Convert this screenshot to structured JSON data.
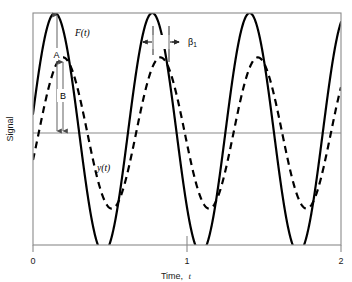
{
  "figure": {
    "y_axis_label": "Signal",
    "x_axis_label": "Time, t",
    "x_axis_label_main": "Time,",
    "x_axis_label_var": "t",
    "x_ticks": [
      "0",
      "1",
      "2"
    ],
    "curve_label_solid": "F(t)",
    "curve_label_dashed": "y(t)",
    "annotation_a": "A",
    "annotation_b": "B",
    "annotation_beta": "β",
    "annotation_beta_sub": "1",
    "colors": {
      "curve": "#000000",
      "frame": "#808080",
      "zero_line": "#808080",
      "annotation": "#808080",
      "background": "#ffffff"
    }
  },
  "chart_data": {
    "type": "line",
    "title": "",
    "subtitle": "",
    "xlabel": "Time, t",
    "ylabel": "Signal",
    "xlim": [
      0,
      2
    ],
    "ylim": [
      -1.05,
      1.05
    ],
    "xticks": [
      0,
      1,
      2
    ],
    "xticklabels": [
      "0",
      "1",
      "2"
    ],
    "yticks": [],
    "yticklabels": [],
    "grid": false,
    "legend": "none",
    "zero_line": 0,
    "period": 0.6325,
    "series": [
      {
        "name": "F(t)",
        "style": "solid",
        "color": "#000000",
        "amplitude": 1.0,
        "phase_peak_t": 0.142,
        "label_annotation": "A",
        "description": "Forcing function, solid line, unit amplitude sinusoid"
      },
      {
        "name": "y(t)",
        "style": "dashed",
        "color": "#000000",
        "amplitude": 0.63,
        "phase_peak_t": 0.195,
        "label_annotation": "B",
        "description": "Response, dashed line, attenuated and phase-lagged sinusoid"
      }
    ],
    "annotations": [
      {
        "label": "A",
        "type": "vertical-double-arrow",
        "meaning": "amplitude of F(t)",
        "from_value": 1.0,
        "to_value": 0.0,
        "at_t": 0.142
      },
      {
        "label": "B",
        "type": "vertical-double-arrow",
        "meaning": "amplitude of y(t)",
        "from_value": 0.63,
        "to_value": 0.0,
        "at_t": 0.165
      },
      {
        "label": "β₁",
        "type": "horizontal-double-arrow",
        "meaning": "phase lag between F(t) and y(t) peaks",
        "from_t": 0.775,
        "to_t": 0.828
      },
      {
        "label": "F(t)",
        "type": "curve-label",
        "at_t": 0.28
      },
      {
        "label": "y(t)",
        "type": "curve-label",
        "at_t": 0.42
      }
    ]
  }
}
